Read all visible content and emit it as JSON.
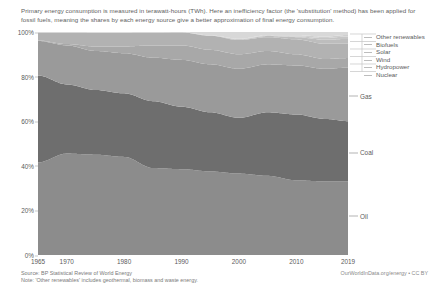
{
  "subtitle": "Primary energy consumption is measured in terawatt-hours (TWh). Here an inefficiency factor (the 'substitution' method) has been applied for fossil fuels, meaning the shares by each energy source give a better approximation of final energy consumption.",
  "footer": {
    "source": "Source: BP Statistical Review of World Energy",
    "note": "Note: 'Other renewables' includes geothermal, biomass and waste energy."
  },
  "attribution": "OurWorldInData.org/energy • CC BY",
  "legend": {
    "items": [
      {
        "label": "Other renewables",
        "color": "#d8d8d8"
      },
      {
        "label": "Biofuels",
        "color": "#cfcfcf"
      },
      {
        "label": "Solar",
        "color": "#c6c6c6"
      },
      {
        "label": "Wind",
        "color": "#bdbdbd"
      },
      {
        "label": "Hydropower",
        "color": "#b2b2b2"
      },
      {
        "label": "Nuclear",
        "color": "#a8a8a8"
      }
    ]
  },
  "series_labels": [
    {
      "label": "Gas",
      "color": "#9a9a9a",
      "y_pct": 71.5
    },
    {
      "label": "Coal",
      "color": "#6e6e6e",
      "y_pct": 46.0
    },
    {
      "label": "Oil",
      "color": "#8c8c8c",
      "y_pct": 17.5
    }
  ],
  "chart_data": {
    "type": "area",
    "title": "",
    "subtitle": "Primary energy consumption is measured in terawatt-hours (TWh). Here an inefficiency factor (the 'substitution' method) has been applied for fossil fuels, meaning the shares by each energy source give a better approximation of final energy consumption.",
    "xlabel": "",
    "ylabel": "",
    "stacked": true,
    "normalized": true,
    "grid": false,
    "legend_position": "right",
    "xlim": [
      1965,
      2019
    ],
    "ylim": [
      0,
      100
    ],
    "ytick_labels": [
      "0%",
      "20%",
      "40%",
      "60%",
      "80%",
      "100%"
    ],
    "ytick_values": [
      0,
      20,
      40,
      60,
      80,
      100
    ],
    "xtick_labels": [
      "1965",
      "1970",
      "1980",
      "1990",
      "2000",
      "2010",
      "2019"
    ],
    "xtick_values": [
      1965,
      1970,
      1980,
      1990,
      2000,
      2010,
      2019
    ],
    "x": [
      1965,
      1970,
      1975,
      1980,
      1985,
      1990,
      1995,
      2000,
      2005,
      2010,
      2015,
      2019
    ],
    "series": [
      {
        "name": "Oil",
        "color": "#8c8c8c",
        "values": [
          41.5,
          45.5,
          45.0,
          44.0,
          39.0,
          38.5,
          37.5,
          36.5,
          35.5,
          33.5,
          33.0,
          33.0
        ]
      },
      {
        "name": "Coal",
        "color": "#6e6e6e",
        "values": [
          39.0,
          31.0,
          29.0,
          28.5,
          30.0,
          28.0,
          26.5,
          25.0,
          28.5,
          29.5,
          28.0,
          27.0
        ]
      },
      {
        "name": "Gas",
        "color": "#9a9a9a",
        "values": [
          15.5,
          17.5,
          17.5,
          18.0,
          19.5,
          21.0,
          21.5,
          22.0,
          21.5,
          22.0,
          22.5,
          24.0
        ]
      },
      {
        "name": "Nuclear",
        "color": "#a8a8a8",
        "values": [
          0.2,
          0.6,
          2.0,
          3.0,
          5.5,
          6.5,
          6.5,
          6.5,
          6.0,
          5.0,
          4.4,
          4.3
        ]
      },
      {
        "name": "Hydropower",
        "color": "#b2b2b2",
        "values": [
          3.6,
          5.2,
          6.2,
          6.2,
          5.8,
          5.8,
          6.3,
          6.4,
          6.2,
          6.7,
          6.8,
          6.4
        ]
      },
      {
        "name": "Wind",
        "color": "#bdbdbd",
        "values": [
          0.0,
          0.0,
          0.0,
          0.0,
          0.0,
          0.05,
          0.1,
          0.3,
          0.5,
          1.0,
          1.8,
          2.2
        ]
      },
      {
        "name": "Solar",
        "color": "#c6c6c6",
        "values": [
          0.0,
          0.0,
          0.0,
          0.0,
          0.0,
          0.0,
          0.02,
          0.04,
          0.1,
          0.3,
          0.8,
          1.1
        ]
      },
      {
        "name": "Biofuels",
        "color": "#cfcfcf",
        "values": [
          0.0,
          0.0,
          0.0,
          0.0,
          0.0,
          0.05,
          0.1,
          0.2,
          0.3,
          0.55,
          0.65,
          0.7
        ]
      },
      {
        "name": "Other renewables",
        "color": "#d8d8d8",
        "values": [
          0.2,
          0.2,
          0.3,
          0.3,
          0.2,
          0.1,
          1.48,
          3.06,
          1.4,
          1.45,
          2.05,
          1.3
        ]
      }
    ]
  }
}
